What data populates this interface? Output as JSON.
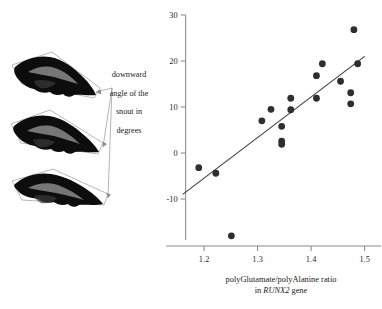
{
  "figure": {
    "annotation": {
      "lines": [
        "downward",
        "angle of the",
        "snout in",
        "degrees"
      ],
      "full_text": "downward angle of the snout in degrees"
    },
    "specimens": [
      {
        "name": "skull-silhouette-top",
        "label": ""
      },
      {
        "name": "skull-silhouette-middle",
        "label": ""
      },
      {
        "name": "skull-silhouette-bottom",
        "label": ""
      }
    ]
  },
  "chart_data": {
    "type": "scatter",
    "title": "",
    "xlabel_line1": "polyGlutamate/polyAlanine ratio",
    "xlabel_line2_prefix": "in ",
    "xlabel_line2_italic": "RUNX2",
    "xlabel_line2_suffix": " gene",
    "ylabel": "downward angle of the snout in degrees",
    "xlim": [
      1.155,
      1.525
    ],
    "ylim": [
      -21,
      30
    ],
    "xticks": [
      1.2,
      1.3,
      1.4,
      1.5
    ],
    "xtick_labels": [
      "1.2",
      "1.3",
      "1.4",
      "1.5"
    ],
    "yticks": [
      30,
      20,
      10,
      0,
      -10
    ],
    "ytick_labels": [
      "30",
      "20",
      "10",
      "0",
      "-10"
    ],
    "grid": false,
    "legend": null,
    "marker_color": "#2e2e2e",
    "line_color": "#3a3a3a",
    "axis_color": "#8a8a8a",
    "x": [
      1.19,
      1.222,
      1.251,
      1.308,
      1.325,
      1.345,
      1.345,
      1.345,
      1.362,
      1.362,
      1.41,
      1.41,
      1.421,
      1.455,
      1.474,
      1.474,
      1.48,
      1.487
    ],
    "y": [
      -3.2,
      -4.4,
      -18.0,
      7.0,
      9.5,
      5.8,
      2.6,
      1.9,
      11.9,
      9.4,
      11.9,
      16.8,
      19.4,
      15.6,
      13.1,
      10.7,
      26.8,
      19.4
    ],
    "points": [
      {
        "x": 1.19,
        "y": -3.2
      },
      {
        "x": 1.222,
        "y": -4.4
      },
      {
        "x": 1.251,
        "y": -18.0
      },
      {
        "x": 1.308,
        "y": 7.0
      },
      {
        "x": 1.325,
        "y": 9.5
      },
      {
        "x": 1.345,
        "y": 5.8
      },
      {
        "x": 1.345,
        "y": 2.6
      },
      {
        "x": 1.345,
        "y": 1.9
      },
      {
        "x": 1.362,
        "y": 11.9
      },
      {
        "x": 1.362,
        "y": 9.4
      },
      {
        "x": 1.41,
        "y": 11.9
      },
      {
        "x": 1.41,
        "y": 16.8
      },
      {
        "x": 1.421,
        "y": 19.4
      },
      {
        "x": 1.455,
        "y": 15.6
      },
      {
        "x": 1.474,
        "y": 13.1
      },
      {
        "x": 1.474,
        "y": 10.7
      },
      {
        "x": 1.48,
        "y": 26.8
      },
      {
        "x": 1.487,
        "y": 19.4
      }
    ],
    "trendline": {
      "type": "linear-fit",
      "x_start": 1.16,
      "y_start": -9.0,
      "x_end": 1.5,
      "y_end": 21.0
    }
  }
}
